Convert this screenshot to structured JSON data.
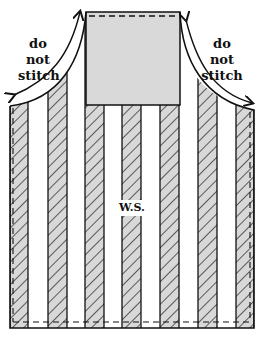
{
  "diagram": {
    "labels": {
      "left_note_line1": "do not",
      "left_note_line2": "stitch",
      "right_note_line1": "do not",
      "right_note_line2": "stitch",
      "center": "W.S."
    },
    "colors": {
      "stripe_fill": "#d8d8d8",
      "bib_fill": "#d9d9d9",
      "outline": "#111111",
      "background": "#ffffff"
    },
    "stripes": [
      {
        "x": 10,
        "w": 18
      },
      {
        "x": 48,
        "w": 19
      },
      {
        "x": 85,
        "w": 19
      },
      {
        "x": 122,
        "w": 19
      },
      {
        "x": 160,
        "w": 19
      },
      {
        "x": 198,
        "w": 19
      },
      {
        "x": 236,
        "w": 18
      }
    ]
  }
}
